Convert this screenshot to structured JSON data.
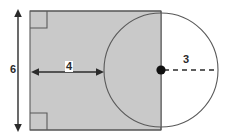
{
  "figure": {
    "background_color": "#ffffff",
    "shape_fill_color": "#c9c9c9",
    "stroke_color": "#595959",
    "annotation_color": "#2b2b2b",
    "labels": {
      "height": "6",
      "width": "4",
      "radius": "3"
    },
    "shapes": {
      "rectangle": {
        "name": "rectangle",
        "x": 30,
        "y": 11,
        "width": 131,
        "height": 119,
        "filled": true
      },
      "circle": {
        "name": "circle",
        "center_x": 161,
        "center_y": 70,
        "radius": 57,
        "filled": false
      }
    },
    "markers": {
      "right_angle_top_left": true,
      "right_angle_bottom_left": true,
      "center_dot": true
    },
    "dimensions": [
      {
        "name": "height-dimension",
        "label": "6",
        "orientation": "vertical",
        "from": 11,
        "to": 130,
        "axis_position": 18
      },
      {
        "name": "width-dimension",
        "label": "4",
        "orientation": "horizontal",
        "from": 31,
        "to": 104,
        "axis_position": 72
      },
      {
        "name": "radius-dimension",
        "label": "3",
        "orientation": "horizontal-dashed",
        "from": 161,
        "to": 218,
        "axis_position": 70
      }
    ]
  }
}
